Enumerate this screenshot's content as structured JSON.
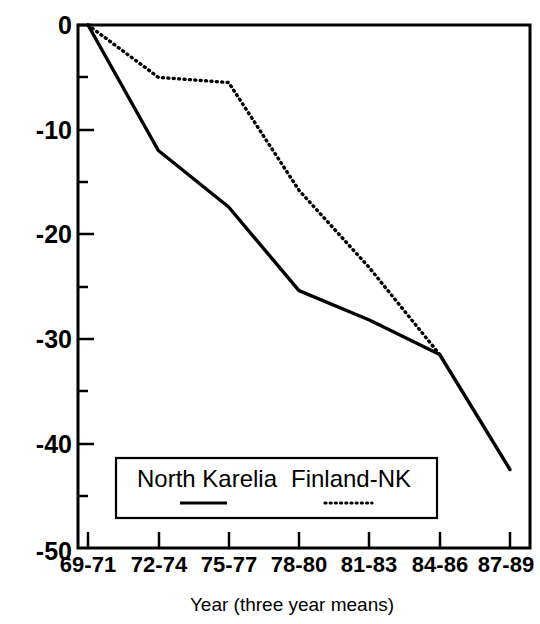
{
  "chart_data": {
    "type": "line",
    "title": "",
    "xlabel": "Year (three year means)",
    "ylabel": "",
    "categories": [
      "69-71",
      "72-74",
      "75-77",
      "78-80",
      "81-83",
      "84-86",
      "87-89"
    ],
    "ylim": [
      -50,
      0
    ],
    "xlim_categories": [
      "69-71",
      "87-89"
    ],
    "y_major_ticks": [
      0,
      -10,
      -20,
      -30,
      -40,
      -50
    ],
    "y_minor_ticks": [
      -5,
      -15,
      -25,
      -35,
      -45
    ],
    "y_tick_labels": [
      "0",
      "-10",
      "-20",
      "-30",
      "-40",
      "-50"
    ],
    "grid": false,
    "legend_position": "bottom-center-inside",
    "series": [
      {
        "name": "North Karelia",
        "style": "solid",
        "color": "#000000",
        "values": [
          0,
          -12,
          -17.4,
          -25.4,
          -28.2,
          -31.5,
          -42.5
        ]
      },
      {
        "name": "Finland-NK",
        "style": "dotted",
        "color": "#000000",
        "values": [
          0,
          -5,
          -5.5,
          -15.8,
          -23.2,
          -31.5,
          null
        ]
      }
    ]
  },
  "axes": {
    "y_tick_labels": [
      "0",
      "-10",
      "-20",
      "-30",
      "-40",
      "-50"
    ],
    "x_tick_labels": [
      "69-71",
      "72-74",
      "75-77",
      "78-80",
      "81-83",
      "84-86",
      "87-89"
    ],
    "x_axis_title": "Year (three year means)"
  },
  "legend": {
    "entries": [
      {
        "label": "North Karelia",
        "style": "solid"
      },
      {
        "label": "Finland-NK",
        "style": "dotted"
      }
    ]
  },
  "colors": {
    "background": "#ffffff",
    "foreground": "#000000",
    "series_north_karelia": "#000000",
    "series_finland_nk": "#000000"
  }
}
